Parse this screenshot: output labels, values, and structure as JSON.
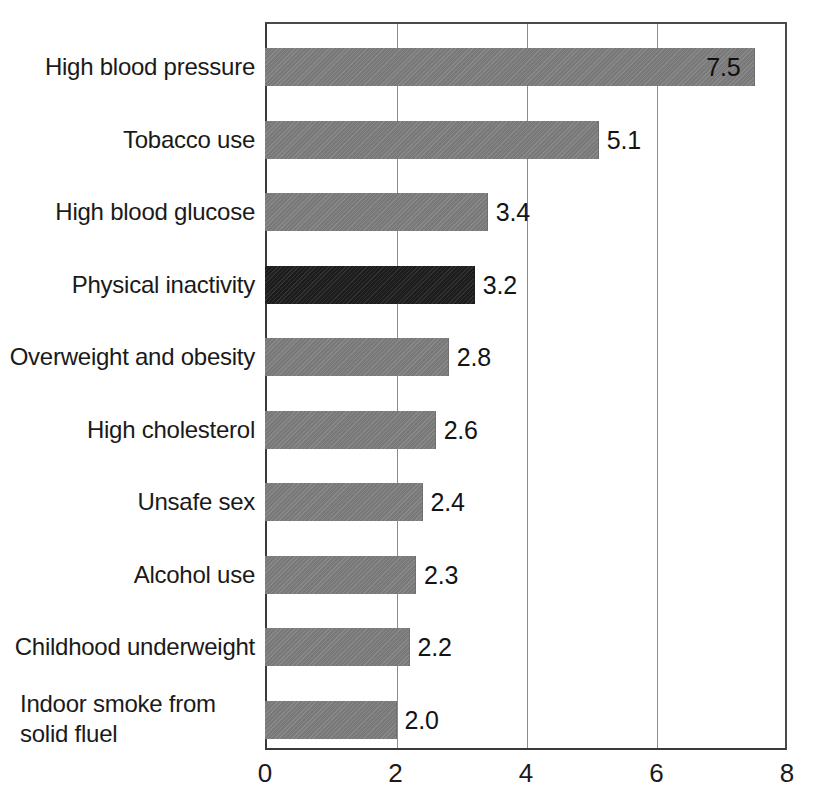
{
  "chart_data": {
    "type": "bar",
    "orientation": "horizontal",
    "title": "",
    "subtitle": "",
    "xlabel": "",
    "ylabel": "",
    "categories": [
      "High blood pressure",
      "Tobacco use",
      "High blood glucose",
      "Physical inactivity",
      "Overweight and obesity",
      "High cholesterol",
      "Unsafe sex",
      "Alcohol use",
      "Childhood underweight",
      "Indoor smoke from solid fluel"
    ],
    "values": [
      7.5,
      5.1,
      3.4,
      3.2,
      2.8,
      2.6,
      2.4,
      2.3,
      2.2,
      2.0
    ],
    "value_labels": [
      "7.5",
      "5.1",
      "3.4",
      "3.2",
      "2.8",
      "2.6",
      "2.4",
      "2.3",
      "2.2",
      "2.0"
    ],
    "highlight_index": 3,
    "xlim": [
      0,
      8
    ],
    "xticks": [
      0,
      2,
      4,
      6,
      8
    ],
    "xtick_labels": [
      "0",
      "2",
      "4",
      "6",
      "8"
    ],
    "grid": "vertical",
    "legend": "none",
    "colors": {
      "bar": "#7e7e7e",
      "bar_highlight": "#262626",
      "axis": "#3a3a3a",
      "gridline": "#8c8c8c",
      "text": "#1a1a1a",
      "background": "#ffffff"
    }
  }
}
